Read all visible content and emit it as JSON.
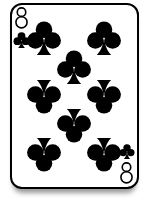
{
  "card": {
    "title": "8 of clubs",
    "rank": "8",
    "suit": "clubs",
    "suit_symbol": "♣",
    "ink_color": "#000000",
    "card_background": "#ffffff",
    "border_color": "#000000",
    "shadow_color": "#999999",
    "corner_top_left": {
      "rank": "8",
      "suit_symbol": "♣"
    },
    "corner_bottom_right": {
      "rank": "8",
      "suit_symbol": "♣"
    },
    "pip_count": 8,
    "pips": [
      {
        "x": 32,
        "y": 33,
        "inverted": false
      },
      {
        "x": 92,
        "y": 33,
        "inverted": false
      },
      {
        "x": 62,
        "y": 62,
        "inverted": false
      },
      {
        "x": 32,
        "y": 92,
        "inverted": true
      },
      {
        "x": 92,
        "y": 92,
        "inverted": true
      },
      {
        "x": 62,
        "y": 121,
        "inverted": true
      },
      {
        "x": 32,
        "y": 150,
        "inverted": true
      },
      {
        "x": 92,
        "y": 150,
        "inverted": true
      }
    ]
  }
}
